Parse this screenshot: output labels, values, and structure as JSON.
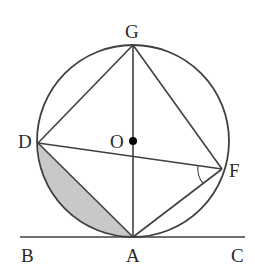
{
  "diagram": {
    "type": "geometry",
    "colors": {
      "stroke": "#404040",
      "shade": "#c8c8c8",
      "label": "#2a2a2a",
      "center_dot": "#000000"
    },
    "labels": {
      "G": "G",
      "O": "O",
      "D": "D",
      "F": "F",
      "B": "B",
      "A": "A",
      "C": "C"
    },
    "points": {
      "G": [
        133,
        45
      ],
      "O": [
        133,
        141
      ],
      "D": [
        38,
        143
      ],
      "F": [
        222,
        169
      ],
      "A": [
        133,
        237
      ],
      "B": [
        20,
        237
      ],
      "C": [
        245,
        237
      ]
    },
    "circle": {
      "center": "O",
      "radius": 96
    },
    "segments": [
      "D-G",
      "G-F",
      "G-A",
      "D-F",
      "D-A",
      "F-A",
      "B-C"
    ],
    "shaded_region": "segment between chord DA and minor arc DA",
    "angle_mark": "angle DFA at F"
  }
}
